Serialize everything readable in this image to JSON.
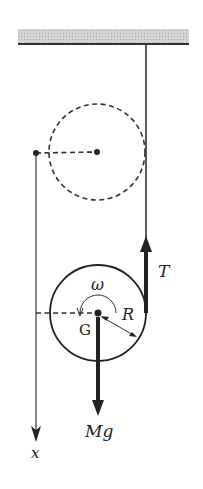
{
  "diagram": {
    "labels": {
      "omega": "ω",
      "G": "G",
      "R": "R",
      "T": "T",
      "Mg_M": "M",
      "Mg_g": "g",
      "x": "x"
    },
    "colors": {
      "ink": "#222222",
      "ceiling_fill": "#c8c8c8"
    }
  }
}
